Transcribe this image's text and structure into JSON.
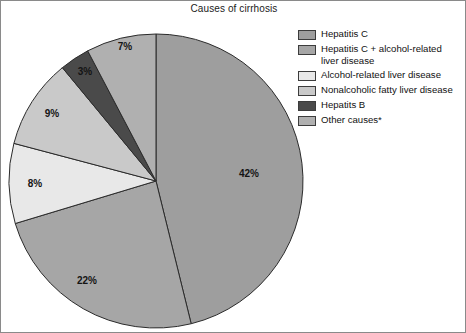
{
  "figure": {
    "title": "Causes of cirrhosis",
    "width": 466,
    "height": 333,
    "border_color": "#8a8a8a",
    "background": "#ffffff"
  },
  "chart_data": {
    "type": "pie",
    "title": "Causes of cirrhosis",
    "xlabel": "",
    "ylabel": "",
    "grid": false,
    "legend_position": "right",
    "start_angle_deg": 90,
    "direction": "clockwise",
    "center": [
      155,
      180
    ],
    "radius": 147,
    "labels": [
      "Hepatitis C",
      "Hepatitis C + alcohol-related liver disease",
      "Alcohol-related liver disease",
      "Nonalcoholic fatty liver disease",
      "Hepatits B",
      "Other causes*"
    ],
    "values": [
      42,
      22,
      8,
      9,
      3,
      7
    ],
    "value_labels": [
      "42%",
      "22%",
      "8%",
      "9%",
      "3%",
      "7%"
    ],
    "colors": [
      "#9e9e9e",
      "#a6a6a6",
      "#e8e8e8",
      "#c9c9c9",
      "#4a4a4a",
      "#b0b0b0"
    ],
    "slices": [
      {
        "label": "Hepatitis C",
        "value": 42,
        "value_label": "42%",
        "color": "#9e9e9e",
        "label_x": 248,
        "label_y": 176
      },
      {
        "label": "Hepatitis C + alcohol-related liver disease",
        "value": 22,
        "value_label": "22%",
        "color": "#a6a6a6",
        "label_x": 86,
        "label_y": 283
      },
      {
        "label": "Alcohol-related liver disease",
        "value": 8,
        "value_label": "8%",
        "color": "#e8e8e8",
        "label_x": 34,
        "label_y": 186
      },
      {
        "label": "Nonalcoholic fatty liver disease",
        "value": 9,
        "value_label": "9%",
        "color": "#c9c9c9",
        "label_x": 51,
        "label_y": 116
      },
      {
        "label": "Hepatits B",
        "value": 3,
        "value_label": "3%",
        "color": "#4a4a4a",
        "label_x": 84,
        "label_y": 74
      },
      {
        "label": "Other causes*",
        "value": 7,
        "value_label": "7%",
        "color": "#b0b0b0",
        "label_x": 124,
        "label_y": 49
      }
    ],
    "slice_edge_color": "#2b2b2b"
  },
  "legend": {
    "items": [
      {
        "label": "Hepatitis C",
        "color": "#9e9e9e"
      },
      {
        "label": "Hepatitis C + alcohol-related\nliver disease",
        "color": "#a6a6a6"
      },
      {
        "label": "Alcohol-related liver disease",
        "color": "#e8e8e8"
      },
      {
        "label": "Nonalcoholic fatty liver disease",
        "color": "#c9c9c9"
      },
      {
        "label": "Hepatits B",
        "color": "#4a4a4a"
      },
      {
        "label": "Other causes*",
        "color": "#b0b0b0"
      }
    ]
  }
}
